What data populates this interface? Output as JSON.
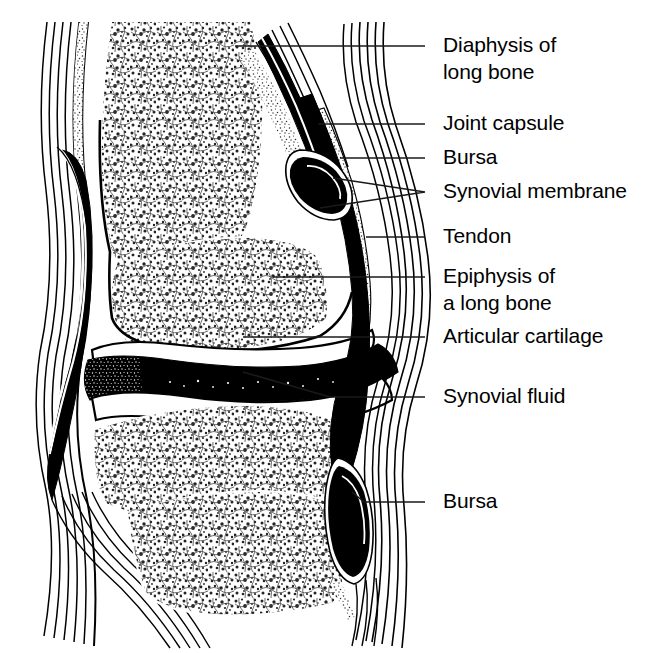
{
  "figure": {
    "background_color": "#ffffff",
    "ink_color": "#000000",
    "width": 672,
    "height": 653
  },
  "labels": [
    {
      "id": "diaphysis",
      "name": "label-diaphysis-of-long-bone",
      "lines": [
        "Diaphysis of",
        "long bone"
      ],
      "line1": "Diaphysis of",
      "line2": "long bone",
      "text_x": 443,
      "text_y": 52,
      "leader": "M 425 46 L 235 46"
    },
    {
      "id": "joint-capsule",
      "name": "label-joint-capsule",
      "lines": [
        "Joint capsule"
      ],
      "line1": "Joint capsule",
      "line2": "",
      "text_x": 443,
      "text_y": 130,
      "leader": "M 425 124 L 318 124"
    },
    {
      "id": "bursa-upper",
      "name": "label-bursa-upper",
      "lines": [
        "Bursa"
      ],
      "line1": "Bursa",
      "line2": "",
      "text_x": 443,
      "text_y": 164,
      "leader": "M 425 158 L 340 158"
    },
    {
      "id": "synovial-membrane",
      "name": "label-synovial-membrane",
      "lines": [
        "Synovial membrane"
      ],
      "line1": "Synovial membrane",
      "line2": "",
      "text_x": 443,
      "text_y": 198,
      "leader": "M 425 192 L 333 178 M 425 192 L 320 208"
    },
    {
      "id": "tendon",
      "name": "label-tendon",
      "lines": [
        "Tendon"
      ],
      "line1": "Tendon",
      "line2": "",
      "text_x": 443,
      "text_y": 243,
      "leader": "M 425 237 L 366 237"
    },
    {
      "id": "epiphysis",
      "name": "label-epiphysis-of-a-long-bone",
      "lines": [
        "Epiphysis of",
        "a long bone"
      ],
      "line1": "Epiphysis of",
      "line2": "a long bone",
      "text_x": 443,
      "text_y": 283,
      "leader": "M 425 277 L 273 277"
    },
    {
      "id": "articular-cartilage",
      "name": "label-articular-cartilage",
      "lines": [
        "Articular cartilage"
      ],
      "line1": "Articular cartilage",
      "line2": "",
      "text_x": 443,
      "text_y": 343,
      "leader": "M 425 337 L 243 337"
    },
    {
      "id": "synovial-fluid",
      "name": "label-synovial-fluid",
      "lines": [
        "Synovial fluid"
      ],
      "line1": "Synovial fluid",
      "line2": "",
      "text_x": 443,
      "text_y": 403,
      "leader": "M 425 397 L 330 397 L 243 372"
    },
    {
      "id": "bursa-lower",
      "name": "label-bursa-lower",
      "lines": [
        "Bursa"
      ],
      "line1": "Bursa",
      "line2": "",
      "text_x": 443,
      "text_y": 508,
      "leader": "M 425 502 L 364 502 L 352 492"
    }
  ],
  "structures": [
    {
      "id": "upper-diaphysis",
      "name": "upper-long-bone-shaft",
      "label": "Diaphysis of long bone"
    },
    {
      "id": "upper-epiphysis",
      "name": "upper-bone-epiphysis",
      "label": "Epiphysis of a long bone"
    },
    {
      "id": "lower-epiphysis",
      "name": "lower-bone-epiphysis",
      "label": "Epiphysis of a long bone"
    },
    {
      "id": "lower-diaphysis",
      "name": "lower-long-bone-shaft",
      "label": "Diaphysis of long bone"
    },
    {
      "id": "joint-cavity",
      "name": "joint-cavity-synovial-fluid",
      "label": "Synovial fluid"
    },
    {
      "id": "cartilage-upper",
      "name": "articular-cartilage-upper",
      "label": "Articular cartilage"
    },
    {
      "id": "cartilage-lower",
      "name": "articular-cartilage-lower",
      "label": "Articular cartilage"
    },
    {
      "id": "capsule-left",
      "name": "joint-capsule-left",
      "label": "Joint capsule"
    },
    {
      "id": "capsule-right",
      "name": "joint-capsule-right",
      "label": "Joint capsule"
    },
    {
      "id": "tendon-right",
      "name": "tendon-right",
      "label": "Tendon"
    },
    {
      "id": "bursa-top-right",
      "name": "bursa-upper-right",
      "label": "Bursa"
    },
    {
      "id": "bursa-bot-right",
      "name": "bursa-lower-right",
      "label": "Bursa"
    },
    {
      "id": "bursa-left",
      "name": "bursa-left",
      "label": "Bursa"
    },
    {
      "id": "synovial-mem",
      "name": "synovial-membrane-lining",
      "label": "Synovial membrane"
    }
  ]
}
